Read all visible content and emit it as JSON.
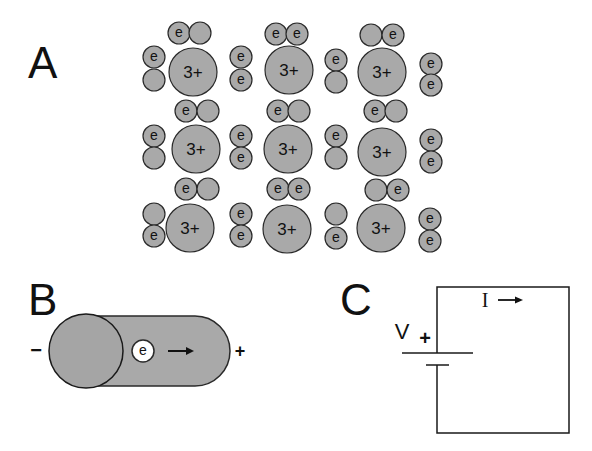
{
  "figure": {
    "panels": [
      {
        "label": "A",
        "description": "Lattice of 3+ ions with shared electron pairs"
      },
      {
        "label": "B",
        "description": "Conductor with electron drifting toward positive terminal"
      },
      {
        "label": "C",
        "description": "Circuit with battery and current"
      }
    ]
  },
  "panel_a": {
    "label": "A",
    "ion_charge": "3+",
    "electron_label": "e",
    "colors": {
      "fill": "#a9a9a9",
      "stroke": "#2a2a2a"
    },
    "ions": [
      {
        "cx": 193,
        "cy": 72
      },
      {
        "cx": 289,
        "cy": 70
      },
      {
        "cx": 382,
        "cy": 72
      },
      {
        "cx": 196,
        "cy": 149
      },
      {
        "cx": 288,
        "cy": 149
      },
      {
        "cx": 382,
        "cy": 152
      },
      {
        "cx": 190,
        "cy": 228
      },
      {
        "cx": 287,
        "cy": 229
      },
      {
        "cx": 381,
        "cy": 228
      }
    ],
    "electrons": [
      {
        "cx": 179,
        "cy": 33,
        "e": true
      },
      {
        "cx": 200,
        "cy": 33,
        "e": false
      },
      {
        "cx": 154,
        "cy": 57,
        "e": true
      },
      {
        "cx": 154,
        "cy": 80,
        "e": false
      },
      {
        "cx": 241,
        "cy": 57,
        "e": true
      },
      {
        "cx": 241,
        "cy": 80,
        "e": true
      },
      {
        "cx": 276,
        "cy": 34,
        "e": true
      },
      {
        "cx": 297,
        "cy": 34,
        "e": true
      },
      {
        "cx": 336,
        "cy": 60,
        "e": true
      },
      {
        "cx": 336,
        "cy": 82,
        "e": false
      },
      {
        "cx": 371,
        "cy": 35,
        "e": false
      },
      {
        "cx": 393,
        "cy": 35,
        "e": true
      },
      {
        "cx": 431,
        "cy": 64,
        "e": true
      },
      {
        "cx": 431,
        "cy": 85,
        "e": true
      },
      {
        "cx": 186,
        "cy": 111,
        "e": true
      },
      {
        "cx": 208,
        "cy": 111,
        "e": false
      },
      {
        "cx": 154,
        "cy": 136,
        "e": true
      },
      {
        "cx": 154,
        "cy": 158,
        "e": false
      },
      {
        "cx": 241,
        "cy": 136,
        "e": true
      },
      {
        "cx": 241,
        "cy": 158,
        "e": true
      },
      {
        "cx": 278,
        "cy": 111,
        "e": true
      },
      {
        "cx": 299,
        "cy": 111,
        "e": false
      },
      {
        "cx": 336,
        "cy": 136,
        "e": true
      },
      {
        "cx": 336,
        "cy": 158,
        "e": false
      },
      {
        "cx": 375,
        "cy": 111,
        "e": true
      },
      {
        "cx": 396,
        "cy": 111,
        "e": false
      },
      {
        "cx": 431,
        "cy": 140,
        "e": true
      },
      {
        "cx": 431,
        "cy": 162,
        "e": true
      },
      {
        "cx": 186,
        "cy": 189,
        "e": true
      },
      {
        "cx": 208,
        "cy": 189,
        "e": false
      },
      {
        "cx": 154,
        "cy": 214,
        "e": false
      },
      {
        "cx": 154,
        "cy": 236,
        "e": true
      },
      {
        "cx": 241,
        "cy": 214,
        "e": true
      },
      {
        "cx": 241,
        "cy": 236,
        "e": true
      },
      {
        "cx": 278,
        "cy": 189,
        "e": true
      },
      {
        "cx": 299,
        "cy": 189,
        "e": true
      },
      {
        "cx": 336,
        "cy": 214,
        "e": false
      },
      {
        "cx": 336,
        "cy": 238,
        "e": true
      },
      {
        "cx": 376,
        "cy": 190,
        "e": false
      },
      {
        "cx": 398,
        "cy": 190,
        "e": true
      },
      {
        "cx": 430,
        "cy": 219,
        "e": true
      },
      {
        "cx": 430,
        "cy": 241,
        "e": true
      }
    ]
  },
  "panel_b": {
    "label": "B",
    "electron_label": "e",
    "negative_symbol": "−",
    "positive_symbol": "+",
    "arrow": "→"
  },
  "panel_c": {
    "label": "C",
    "voltage_label": "V",
    "positive_symbol": "+",
    "current_label": "I",
    "arrow": "→"
  }
}
